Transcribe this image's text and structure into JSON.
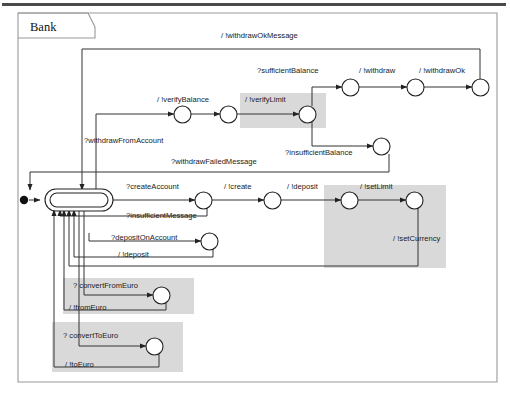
{
  "diagram": {
    "kind": "uml-state-machine",
    "frame_title": "Bank",
    "states": [
      {
        "id": "initial",
        "label": "",
        "kind": "initial-pseudostate",
        "x": 24,
        "y": 200
      },
      {
        "id": "idle",
        "label": "",
        "kind": "composite",
        "x": 78,
        "y": 200
      },
      {
        "id": "s_verifyBal_1",
        "label": "",
        "kind": "simple",
        "x": 182,
        "y": 114
      },
      {
        "id": "s_verifyBal_2",
        "label": "",
        "kind": "simple",
        "x": 228,
        "y": 114
      },
      {
        "id": "s_verifyLimit",
        "label": "",
        "kind": "simple",
        "x": 307,
        "y": 114
      },
      {
        "id": "s_suffBal",
        "label": "",
        "kind": "simple",
        "x": 350,
        "y": 87
      },
      {
        "id": "s_withdraw",
        "label": "",
        "kind": "simple",
        "x": 415,
        "y": 87
      },
      {
        "id": "s_withdrawOk",
        "label": "",
        "kind": "simple",
        "x": 480,
        "y": 87
      },
      {
        "id": "s_insuffBal",
        "label": "",
        "kind": "simple",
        "x": 381,
        "y": 146
      },
      {
        "id": "s_createAcc",
        "label": "",
        "kind": "simple",
        "x": 203,
        "y": 200
      },
      {
        "id": "s_create",
        "label": "",
        "kind": "simple",
        "x": 272,
        "y": 200
      },
      {
        "id": "s_deposit_top",
        "label": "",
        "kind": "simple",
        "x": 349,
        "y": 200
      },
      {
        "id": "s_setLimit",
        "label": "",
        "kind": "simple",
        "x": 414,
        "y": 200
      },
      {
        "id": "s_depositAcc",
        "label": "",
        "kind": "simple",
        "x": 209,
        "y": 241
      },
      {
        "id": "s_convFromEuro",
        "label": "",
        "kind": "simple",
        "x": 161,
        "y": 295
      },
      {
        "id": "s_convToEuro",
        "label": "",
        "kind": "simple",
        "x": 154,
        "y": 346
      }
    ],
    "transition_labels": [
      {
        "id": "t_withdrawOkMessage",
        "text": "/ !withdrawOkMessage",
        "x": 221,
        "y": 38
      },
      {
        "id": "t_sufficientBalance",
        "text": "?sufficientBalance",
        "x": 257,
        "y": 73
      },
      {
        "id": "t_withdraw",
        "text": "/ !withdraw",
        "x": 359,
        "y": 73
      },
      {
        "id": "t_withdrawOk",
        "text": "/ !withdrawOk",
        "x": 419,
        "y": 73
      },
      {
        "id": "t_verifyBalance",
        "text": "/ !verifyBalance",
        "x": 157,
        "y": 102
      },
      {
        "id": "t_verifyLimit",
        "text": "/ !verifyLimit",
        "x": 245,
        "y": 102
      },
      {
        "id": "t_withdrawFromAccount",
        "text": "?withdrawFromAccount",
        "x": 84,
        "y": 143
      },
      {
        "id": "t_insufficientBalance",
        "text": "?insufficientBalance",
        "x": 285,
        "y": 155
      },
      {
        "id": "t_withdrawFailedMsg",
        "text": "?withdrawFailedMessage",
        "x": 171,
        "y": 164
      },
      {
        "id": "t_createAccount",
        "text": "?createAccount",
        "x": 126,
        "y": 189
      },
      {
        "id": "t_create",
        "text": "/ !create",
        "x": 224,
        "y": 189
      },
      {
        "id": "t_depositTop",
        "text": "/ !deposit",
        "x": 287,
        "y": 189
      },
      {
        "id": "t_setLimit",
        "text": "/ !setLimit",
        "x": 360,
        "y": 189
      },
      {
        "id": "t_insufficientMessage",
        "text": "?insufficientMessage",
        "x": 126,
        "y": 218
      },
      {
        "id": "t_depositOnAccount",
        "text": "?depositOnAccount",
        "x": 111,
        "y": 240
      },
      {
        "id": "t_setCurrency",
        "text": "/ !setCurrency",
        "x": 393,
        "y": 241
      },
      {
        "id": "t_deposit",
        "text": "/ !deposit",
        "x": 118,
        "y": 257
      },
      {
        "id": "t_convertFromEuro",
        "text": "? convertFromEuro",
        "x": 73,
        "y": 288
      },
      {
        "id": "t_fromEuro",
        "text": "/ !fromEuro",
        "x": 69,
        "y": 310
      },
      {
        "id": "t_convertToEuro",
        "text": "? convertToEuro",
        "x": 63,
        "y": 338
      },
      {
        "id": "t_toEuro",
        "text": "/ !toEuro",
        "x": 65,
        "y": 367
      }
    ],
    "highlights": [
      {
        "id": "hl-verify-limit",
        "x": 240,
        "y": 93,
        "w": 86,
        "h": 35
      },
      {
        "id": "hl-set-limit",
        "x": 324,
        "y": 185,
        "w": 122,
        "h": 83
      },
      {
        "id": "hl-convert-from-euro",
        "x": 63,
        "y": 278,
        "w": 131,
        "h": 36
      },
      {
        "id": "hl-convert-to-euro",
        "x": 52,
        "y": 322,
        "w": 131,
        "h": 50
      }
    ],
    "colors": {
      "highlight": "#d9d9d9",
      "stroke": "#333333",
      "frame": "#9a9a9a",
      "topbar": "#4a4a4a",
      "text": "#1a1a1a"
    }
  }
}
